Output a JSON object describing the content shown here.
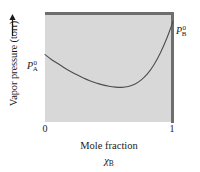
{
  "chart_data": {
    "type": "line",
    "title": "",
    "xlabel": "Mole fraction",
    "xlabel_symbol_base": "χ",
    "xlabel_symbol_sub": "B",
    "ylabel": "Vapor pressure (torr)",
    "xlim": [
      0,
      1
    ],
    "xticks": [
      "0",
      "1"
    ],
    "xtick_values": [
      0,
      1
    ],
    "yticks": [],
    "grid": false,
    "legend": null,
    "series": [
      {
        "name": "total vapor pressure",
        "description": "negative-deviation (below Raoult's law) total vapor pressure curve with a minimum near x(B) = 0.6",
        "x": [
          0.0,
          0.05,
          0.1,
          0.15,
          0.2,
          0.25,
          0.3,
          0.35,
          0.4,
          0.45,
          0.5,
          0.55,
          0.6,
          0.65,
          0.7,
          0.75,
          0.8,
          0.85,
          0.9,
          0.95,
          1.0
        ],
        "y": [
          0.49,
          0.455,
          0.425,
          0.395,
          0.368,
          0.343,
          0.32,
          0.3,
          0.283,
          0.27,
          0.26,
          0.254,
          0.252,
          0.258,
          0.275,
          0.305,
          0.35,
          0.415,
          0.5,
          0.605,
          0.73
        ]
      }
    ],
    "annotations": [
      {
        "name": "p-a-pure",
        "base": "P",
        "superscript": "0",
        "subscript": "A",
        "at_x": 0.0,
        "position": "left-of-axis"
      },
      {
        "name": "p-b-pure",
        "base": "P",
        "superscript": "0",
        "subscript": "B",
        "at_x": 1.0,
        "position": "right-of-axis"
      }
    ],
    "colors": {
      "plot_background": "#d8d8d8",
      "border": "#6e6e6e",
      "curve": "#4d4d4d",
      "text": "#1a1a1a",
      "page_background": "#ffffff"
    }
  }
}
